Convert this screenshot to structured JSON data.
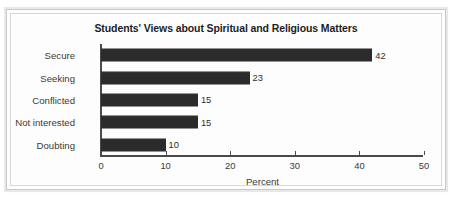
{
  "chart_data": {
    "type": "bar",
    "orientation": "horizontal",
    "title": "Students' Views about Spiritual and Religious Matters",
    "xlabel": "Percent",
    "ylabel": "",
    "categories": [
      "Secure",
      "Seeking",
      "Conflicted",
      "Not interested",
      "Doubting"
    ],
    "values": [
      42,
      23,
      15,
      15,
      10
    ],
    "data_labels": [
      "42",
      "23",
      "15",
      "15",
      "10"
    ],
    "xlim": [
      0,
      50
    ],
    "xticks": [
      0,
      10,
      20,
      30,
      40,
      50
    ],
    "xtick_labels": [
      "0",
      "10",
      "20",
      "30",
      "40",
      "50"
    ],
    "grid": false,
    "legend": false,
    "bar_color": "#2b2b2b",
    "axis_color": "#4a4a4a",
    "background_color": "#fdfdfd",
    "frame_color": "#c9c9c9"
  }
}
